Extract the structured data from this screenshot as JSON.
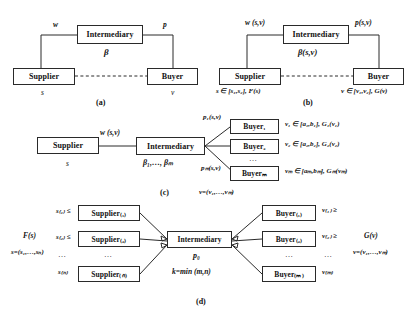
{
  "figure": {
    "panels": [
      {
        "id": "a",
        "caption": "(a)",
        "nodes": {
          "supplier": "Supplier",
          "intermediary": "Intermediary",
          "buyer": "Buyer"
        },
        "labels": {
          "w": "w",
          "p": "p",
          "beta": "β",
          "s": "s",
          "v": "v"
        }
      },
      {
        "id": "b",
        "caption": "(b)",
        "nodes": {
          "supplier": "Supplier",
          "intermediary": "Intermediary",
          "buyer": "Buyer"
        },
        "labels": {
          "w": "w (s,v)",
          "p": "p(s,v)",
          "beta": "β(s,v)",
          "s_dist": "s ∈ [s₁,s₂], F(s)",
          "v_dist": "v ∈ [v₁,v₂], G(v)"
        }
      },
      {
        "id": "c",
        "caption": "(c)",
        "nodes": {
          "supplier": "Supplier",
          "intermediary": "Intermediary",
          "buyers": [
            "Buyer₁",
            "Buyer₂",
            "Buyerₘ"
          ]
        },
        "labels": {
          "w": "w (s,v)",
          "s": "s",
          "betas": "β₁,…, βₘ",
          "p_first": "p₁(s,v)",
          "p_last": "pₘ(s,v)",
          "ellipsis": "…",
          "buyer_dists": [
            "v₁ ∈ [a₁,b₁], G₁(v₁)",
            "v₂ ∈ [a₂,b₂], G₂(v₂)",
            "vₘ ∈ [aₘ,bₘ], Gₘ(vₘ)"
          ],
          "v_vector": "v=(v₁,…,vₘ)"
        }
      },
      {
        "id": "d",
        "caption": "(d)",
        "nodes": {
          "suppliers": [
            "Supplier₍₁₎",
            "Supplier₍₂₎",
            "Supplier₍ₙ₎"
          ],
          "intermediary": "Intermediary",
          "buyers": [
            "Buyer₍₁₎",
            "Buyer₍₂₎",
            "Buyer₍ₘ₎"
          ]
        },
        "labels": {
          "F": "F(s)",
          "s_vector": "s=(s₁,…,sₙ)",
          "G": "G(v)",
          "v_vector": "v=(v₁,…,vₘ)",
          "supplier_costs": [
            "s₍₁₎ ≤",
            "s₍₂₎ ≤",
            "s₍ₙ₎"
          ],
          "buyer_values": [
            "v₍₁₎ ≥",
            "v₍₂₎ ≥",
            "v₍ₘ₎"
          ],
          "p0": "p₀",
          "k": "k=min (m,n)",
          "ellipsis": "…"
        }
      }
    ],
    "colors": {
      "stroke": "#2a2a2a",
      "background": "#ffffff",
      "text": "#111111"
    }
  }
}
